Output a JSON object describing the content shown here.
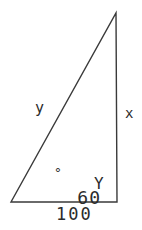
{
  "figure": {
    "type": "geometry-diagram",
    "shape": "right-triangle",
    "background_color": "#ffffff",
    "stroke_color": "#3a3a3a",
    "text_color": "#2b2b2b",
    "vertices": {
      "apex": {
        "x": 116,
        "y": 13
      },
      "bottom_left": {
        "x": 11,
        "y": 202
      },
      "bottom_right": {
        "x": 117,
        "y": 202
      }
    },
    "labels": {
      "hypotenuse": "y",
      "vertical_leg": "x",
      "base": "100",
      "angle_bottom_left": "60",
      "angle_degree_symbol": "°",
      "vertex_bottom_right": "Y"
    }
  }
}
